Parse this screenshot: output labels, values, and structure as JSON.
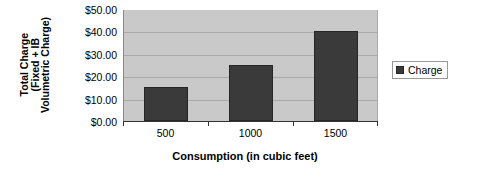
{
  "chart_data": {
    "type": "bar",
    "title": "",
    "subtitle": "",
    "categories": [
      "500",
      "1000",
      "1500"
    ],
    "values": [
      15.0,
      25.0,
      40.0
    ],
    "series": [
      {
        "name": "Charge",
        "values": [
          15.0,
          25.0,
          40.0
        ]
      }
    ],
    "xlabel": "Consumption (in cubic feet)",
    "ylabel_lines": [
      "Total Charge",
      "(Fixed + IB",
      "Volumetric Charge)"
    ],
    "ylabel": "Total Charge (Fixed + IB Volumetric Charge)",
    "ylim": [
      0,
      50
    ],
    "ytick_values": [
      0,
      10,
      20,
      30,
      40,
      50
    ],
    "ytick_labels": [
      "$0.00",
      "$10.00",
      "$20.00",
      "$30.00",
      "$40.00",
      "$50.00"
    ],
    "grid": true,
    "grid_axis": "y",
    "legend": {
      "position": "right",
      "entries": [
        {
          "label": "Charge",
          "color": "#3a3a3a",
          "marker": "legend-swatch-square"
        }
      ]
    },
    "colors": {
      "bar": "#3a3a3a",
      "bar_edge": "#262626",
      "plot_background": "#c9c9c9",
      "gridline": "#a9a9a9",
      "axis_line": "#333333",
      "canvas_background": "#ffffff",
      "text": "#000000"
    }
  }
}
